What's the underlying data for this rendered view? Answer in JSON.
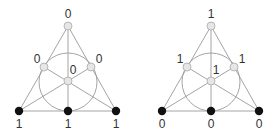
{
  "diagrams": [
    {
      "name": "fano-plane-left",
      "offset_x": 0,
      "nodes": [
        {
          "id": "top",
          "label": "0",
          "color": "#e6e6e6"
        },
        {
          "id": "mid-left",
          "label": "0",
          "color": "#e6e6e6"
        },
        {
          "id": "mid-right",
          "label": "0",
          "color": "#e6e6e6"
        },
        {
          "id": "center",
          "label": "0",
          "color": "#e6e6e6"
        },
        {
          "id": "bottom-left",
          "label": "1",
          "color": "#111111"
        },
        {
          "id": "bottom-mid",
          "label": "1",
          "color": "#111111"
        },
        {
          "id": "bottom-right",
          "label": "1",
          "color": "#111111"
        }
      ]
    },
    {
      "name": "fano-plane-right",
      "offset_x": 143,
      "nodes": [
        {
          "id": "top",
          "label": "1",
          "color": "#e6e6e6"
        },
        {
          "id": "mid-left",
          "label": "1",
          "color": "#e6e6e6"
        },
        {
          "id": "mid-right",
          "label": "1",
          "color": "#e6e6e6"
        },
        {
          "id": "center",
          "label": "1",
          "color": "#e6e6e6"
        },
        {
          "id": "bottom-left",
          "label": "0",
          "color": "#111111"
        },
        {
          "id": "bottom-mid",
          "label": "0",
          "color": "#111111"
        },
        {
          "id": "bottom-right",
          "label": "0",
          "color": "#111111"
        }
      ]
    }
  ]
}
